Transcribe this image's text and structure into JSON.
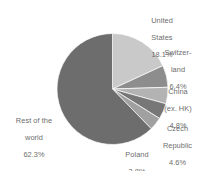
{
  "chart_data": {
    "type": "pie",
    "title": "",
    "subtitle": "",
    "xlabel": "",
    "ylabel": "",
    "legend_position": "outside-labels",
    "grid": false,
    "units": "percent",
    "start_angle_deg": 0,
    "direction": "clockwise",
    "categories": [
      "United States",
      "Switzerland",
      "China (ex. HK)",
      "Czech Republic",
      "Poland",
      "Rest of the world"
    ],
    "values": [
      18.1,
      6.4,
      4.8,
      4.6,
      3.8,
      62.3
    ],
    "colors": [
      "#c9c9c9",
      "#8d8d8d",
      "#b3b3b3",
      "#777777",
      "#a0a0a0",
      "#6d6d6d"
    ],
    "slices": [
      {
        "name": "United States",
        "value": 18.1,
        "value_label": "18.1%",
        "color": "#c9c9c9"
      },
      {
        "name": "Switzerland",
        "value": 6.4,
        "value_label": "6.4%",
        "color": "#8d8d8d"
      },
      {
        "name": "China (ex. HK)",
        "value": 4.8,
        "value_label": "4.8%",
        "color": "#b3b3b3"
      },
      {
        "name": "Czech Republic",
        "value": 4.6,
        "value_label": "4.6%",
        "color": "#777777"
      },
      {
        "name": "Poland",
        "value": 3.8,
        "value_label": "3.8%",
        "color": "#a0a0a0"
      },
      {
        "name": "Rest of the world",
        "value": 62.3,
        "value_label": "62.3%",
        "color": "#6d6d6d"
      }
    ]
  },
  "labels": {
    "united_states": {
      "line1": "United",
      "line2": "States",
      "value": "18.1%"
    },
    "switzerland": {
      "line1": "Switzer-",
      "line2": "land",
      "value": "6.4%"
    },
    "china": {
      "line1": "China",
      "line2": "(ex. HK)",
      "value": "4.8%"
    },
    "czech": {
      "line1": "Czech",
      "line2": "Republic",
      "value": "4.6%"
    },
    "poland": {
      "line1": "Poland",
      "value": "3.8%"
    },
    "rest_of_world": {
      "line1": "Rest of the",
      "line2": "world",
      "value": "62.3%"
    }
  }
}
